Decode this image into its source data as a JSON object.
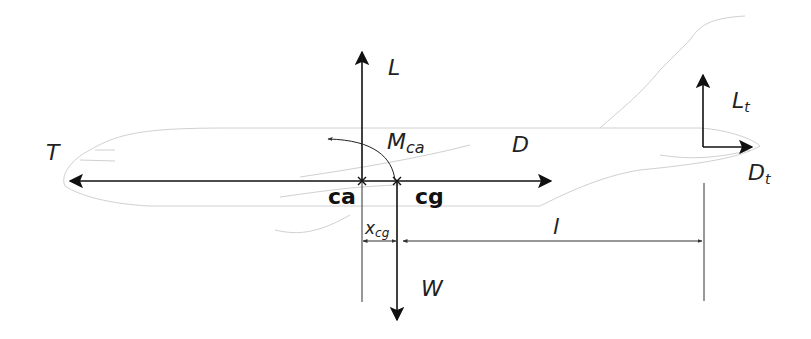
{
  "diagram": {
    "forces": [
      {
        "id": "L",
        "label": "L",
        "description": "Lift at aerodynamic center",
        "direction": "up"
      },
      {
        "id": "W",
        "label": "W",
        "description": "Weight at center of gravity",
        "direction": "down"
      },
      {
        "id": "T",
        "label": "T",
        "description": "Thrust",
        "direction": "left"
      },
      {
        "id": "D",
        "label": "D",
        "description": "Drag",
        "direction": "right"
      },
      {
        "id": "Lt",
        "label": "L",
        "subscript": "t",
        "description": "Tail lift",
        "direction": "up"
      },
      {
        "id": "Dt",
        "label": "D",
        "subscript": "t",
        "description": "Tail drag",
        "direction": "right"
      }
    ],
    "moment": {
      "label": "M",
      "subscript": "ca",
      "description": "Moment about aerodynamic center"
    },
    "points": [
      {
        "id": "ca",
        "label": "ca"
      },
      {
        "id": "cg",
        "label": "cg"
      }
    ],
    "dimensions": [
      {
        "id": "xcg",
        "label": "x",
        "subscript": "cg"
      },
      {
        "id": "l",
        "label": "l"
      }
    ],
    "colors": {
      "ink": "#111111",
      "outline": "#d0d0d0",
      "background": "#ffffff"
    }
  }
}
